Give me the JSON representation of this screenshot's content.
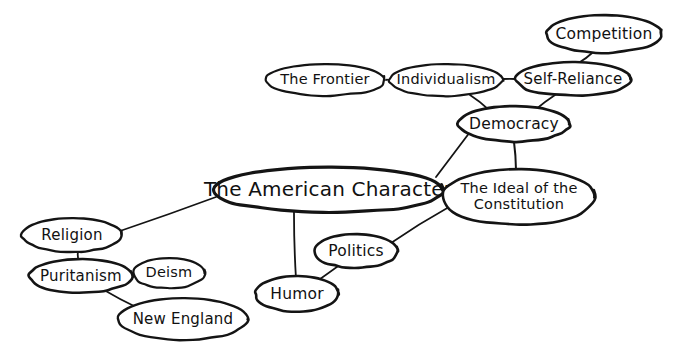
{
  "diagram": {
    "style": "hand-drawn mind map, black ink on white",
    "ink_color": "#141414",
    "background_color": "#ffffff",
    "nodes": [
      {
        "id": "american_character",
        "label": "The American Character",
        "cx": 328,
        "cy": 190,
        "rx": 115,
        "ry": 23,
        "font_size": 20,
        "stroke_width": 3.2,
        "lines": [
          "The American Character"
        ]
      },
      {
        "id": "the_frontier",
        "label": "The Frontier",
        "cx": 325,
        "cy": 80,
        "rx": 60,
        "ry": 16,
        "font_size": 14.5,
        "stroke_width": 2.2,
        "lines": [
          "The Frontier"
        ]
      },
      {
        "id": "individualism",
        "label": "Individualism",
        "cx": 446,
        "cy": 80,
        "rx": 57,
        "ry": 16,
        "font_size": 14.5,
        "stroke_width": 2.2,
        "lines": [
          "Individualism"
        ]
      },
      {
        "id": "self_reliance",
        "label": "Self-Reliance",
        "cx": 573,
        "cy": 79,
        "rx": 58,
        "ry": 17,
        "font_size": 15,
        "stroke_width": 2.6,
        "lines": [
          "Self-Reliance"
        ]
      },
      {
        "id": "competition",
        "label": "Competition",
        "cx": 604,
        "cy": 34,
        "rx": 58,
        "ry": 19,
        "font_size": 15.5,
        "stroke_width": 2.6,
        "lines": [
          "Competition"
        ]
      },
      {
        "id": "democracy",
        "label": "Democracy",
        "cx": 514,
        "cy": 124,
        "rx": 56,
        "ry": 18,
        "font_size": 15.5,
        "stroke_width": 2.8,
        "lines": [
          "Democracy"
        ]
      },
      {
        "id": "ideal_constitution",
        "label": "The Ideal of the Constitution",
        "cx": 519,
        "cy": 197,
        "rx": 77,
        "ry": 28,
        "font_size": 14.5,
        "stroke_width": 2.6,
        "lines": [
          "The Ideal of the",
          "Constitution"
        ]
      },
      {
        "id": "religion",
        "label": "Religion",
        "cx": 72,
        "cy": 235,
        "rx": 50,
        "ry": 17,
        "font_size": 15,
        "stroke_width": 2.4,
        "lines": [
          "Religion"
        ]
      },
      {
        "id": "puritanism",
        "label": "Puritanism",
        "cx": 81,
        "cy": 276,
        "rx": 52,
        "ry": 17,
        "font_size": 15,
        "stroke_width": 2.6,
        "lines": [
          "Puritanism"
        ]
      },
      {
        "id": "deism",
        "label": "Deism",
        "cx": 169,
        "cy": 273,
        "rx": 36,
        "ry": 15,
        "font_size": 14.5,
        "stroke_width": 2.2,
        "lines": [
          "Deism"
        ]
      },
      {
        "id": "new_england",
        "label": "New England",
        "cx": 183,
        "cy": 319,
        "rx": 65,
        "ry": 21,
        "font_size": 15,
        "stroke_width": 2.4,
        "lines": [
          "New England"
        ]
      },
      {
        "id": "humor",
        "label": "Humor",
        "cx": 297,
        "cy": 294,
        "rx": 42,
        "ry": 18,
        "font_size": 15.5,
        "stroke_width": 2.6,
        "lines": [
          "Humor"
        ]
      },
      {
        "id": "politics",
        "label": "Politics",
        "cx": 356,
        "cy": 251,
        "rx": 42,
        "ry": 17,
        "font_size": 15.5,
        "stroke_width": 2.6,
        "lines": [
          "Politics"
        ]
      }
    ],
    "edges": [
      {
        "id": "frontier-individualism",
        "from": "the_frontier",
        "to": "individualism",
        "x1": 386,
        "y1": 80,
        "x2": 389,
        "y2": 80,
        "width": 1.8
      },
      {
        "id": "individualism-selfreliance",
        "from": "individualism",
        "to": "self_reliance",
        "x1": 503,
        "y1": 79,
        "x2": 515,
        "y2": 79,
        "width": 1.8
      },
      {
        "id": "selfreliance-competition",
        "from": "self_reliance",
        "to": "competition",
        "x1": 580,
        "y1": 62,
        "x2": 592,
        "y2": 53,
        "width": 1.8
      },
      {
        "id": "individualism-democracy",
        "from": "individualism",
        "to": "democracy",
        "x1": 470,
        "y1": 95,
        "x2": 489,
        "y2": 110,
        "width": 1.8
      },
      {
        "id": "selfreliance-democracy",
        "from": "self_reliance",
        "to": "democracy",
        "x1": 555,
        "y1": 95,
        "x2": 535,
        "y2": 110,
        "width": 1.8
      },
      {
        "id": "democracy-ideal",
        "from": "democracy",
        "to": "ideal_constitution",
        "x1": 514,
        "y1": 142,
        "x2": 516,
        "y2": 170,
        "width": 2.0
      },
      {
        "id": "democracy-character",
        "from": "democracy",
        "to": "american_character",
        "x1": 470,
        "y1": 132,
        "x2": 436,
        "y2": 177,
        "width": 1.8
      },
      {
        "id": "character-ideal",
        "from": "american_character",
        "to": "ideal_constitution",
        "x1": 440,
        "y1": 192,
        "x2": 446,
        "y2": 192,
        "width": 1.8
      },
      {
        "id": "religion-character",
        "from": "religion",
        "to": "american_character",
        "x1": 120,
        "y1": 231,
        "x2": 216,
        "y2": 197,
        "width": 1.6
      },
      {
        "id": "religion-puritanism",
        "from": "religion",
        "to": "puritanism",
        "x1": 78,
        "y1": 252,
        "x2": 79,
        "y2": 262,
        "width": 1.8
      },
      {
        "id": "puritanism-deism",
        "from": "puritanism",
        "to": "deism",
        "x1": 131,
        "y1": 274,
        "x2": 135,
        "y2": 273,
        "width": 1.8
      },
      {
        "id": "puritanism-newengland",
        "from": "puritanism",
        "to": "new_england",
        "x1": 104,
        "y1": 290,
        "x2": 136,
        "y2": 307,
        "width": 1.6
      },
      {
        "id": "character-humor",
        "from": "american_character",
        "to": "humor",
        "x1": 294,
        "y1": 212,
        "x2": 296,
        "y2": 279,
        "width": 1.8
      },
      {
        "id": "humor-politics",
        "from": "humor",
        "to": "politics",
        "x1": 313,
        "y1": 284,
        "x2": 341,
        "y2": 264,
        "width": 1.6
      },
      {
        "id": "politics-ideal",
        "from": "politics",
        "to": "ideal_constitution",
        "x1": 391,
        "y1": 243,
        "x2": 449,
        "y2": 207,
        "width": 1.6
      }
    ]
  }
}
